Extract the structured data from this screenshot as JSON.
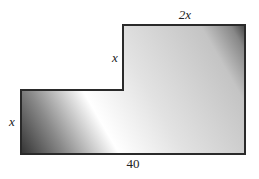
{
  "diagram": {
    "type": "L-shaped polygon",
    "labels": {
      "top": "2x",
      "notch_vertical": "x",
      "left": "x",
      "bottom": "40"
    },
    "colors": {
      "stroke": "#2a2a2a",
      "fill_light": "#ffffff",
      "fill_mid": "#c8c8c8",
      "fill_dark": "#3a3a3a"
    }
  }
}
